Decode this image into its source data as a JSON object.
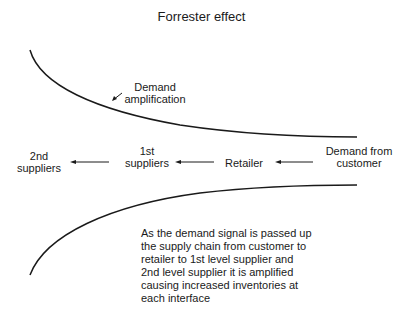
{
  "title": "Forrester effect",
  "annotation": {
    "line1": "Demand",
    "line2": "amplification"
  },
  "chain": [
    {
      "line1": "2nd",
      "line2": "suppliers"
    },
    {
      "line1": "1st",
      "line2": "suppliers"
    },
    {
      "line1": "Retailer",
      "line2": ""
    },
    {
      "line1": "Demand from",
      "line2": "customer"
    }
  ],
  "description": [
    "As the demand signal is passed up",
    "the supply chain from customer to",
    "retailer to 1st level supplier and",
    "2nd level supplier it is amplified",
    "causing increased inventories at",
    "each interface"
  ],
  "colors": {
    "line": "#1a1a1a",
    "text": "#1a1a1a",
    "background": "#ffffff"
  }
}
